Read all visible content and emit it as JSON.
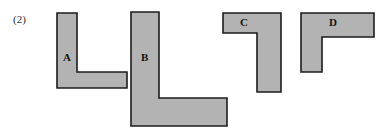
{
  "figure": {
    "caption": "(2)",
    "caption_x": 13,
    "caption_y": 14,
    "background_color": "#ffffff",
    "fill_color": "#b3b3b3",
    "stroke_color": "#1c1c1c",
    "stroke_width": 1.6,
    "width": 384,
    "height": 136
  },
  "shapes": [
    {
      "id": "shape-a",
      "label": "A",
      "description": "L-shaped polygon, vertical bar on left with horizontal foot extending right",
      "label_x": 63,
      "label_y": 52,
      "points": "57,13 77,13 77,72 127,72 127,88 57,88",
      "bbox": {
        "x": 57,
        "y": 13,
        "width": 70,
        "height": 75
      }
    },
    {
      "id": "shape-b",
      "label": "B",
      "description": "Large L-shaped polygon, tall vertical bar with horizontal foot extending right",
      "label_x": 141,
      "label_y": 52,
      "points": "131,12 159,12 159,98 227,98 227,126 131,126",
      "bbox": {
        "x": 131,
        "y": 12,
        "width": 96,
        "height": 114
      }
    },
    {
      "id": "shape-c",
      "label": "C",
      "description": "Mirrored L-shaped polygon resembling a seven, horizontal top bar with vertical leg descending at right",
      "label_x": 240,
      "label_y": 17,
      "points": "223,13 281,13 281,92 257,92 257,33 223,33",
      "bbox": {
        "x": 223,
        "y": 13,
        "width": 58,
        "height": 79
      }
    },
    {
      "id": "shape-d",
      "label": "D",
      "description": "Inverted L-shaped polygon, horizontal top bar with vertical leg descending at left",
      "label_x": 329,
      "label_y": 17,
      "points": "301,13 374,13 374,37 322,37 322,72 301,72",
      "bbox": {
        "x": 301,
        "y": 13,
        "width": 73,
        "height": 59
      }
    }
  ]
}
